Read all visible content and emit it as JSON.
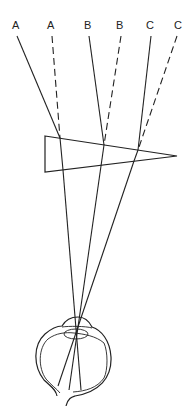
{
  "diagram": {
    "labels": [
      {
        "id": "A1",
        "text": "A",
        "x": 16,
        "y": 29,
        "kind": "actual"
      },
      {
        "id": "A2",
        "text": "A",
        "x": 51,
        "y": 29,
        "kind": "apparent"
      },
      {
        "id": "B1",
        "text": "B",
        "x": 88,
        "y": 29,
        "kind": "actual"
      },
      {
        "id": "B2",
        "text": "B",
        "x": 120,
        "y": 29,
        "kind": "apparent"
      },
      {
        "id": "C1",
        "text": "C",
        "x": 150,
        "y": 29,
        "kind": "actual"
      },
      {
        "id": "C2",
        "text": "C",
        "x": 178,
        "y": 29,
        "kind": "apparent"
      }
    ],
    "prism": {
      "top_left": [
        45,
        136
      ],
      "bottom_left": [
        45,
        172
      ],
      "apex": [
        177,
        156
      ]
    },
    "colors": {
      "line": "#222222",
      "background": "#ffffff"
    }
  }
}
